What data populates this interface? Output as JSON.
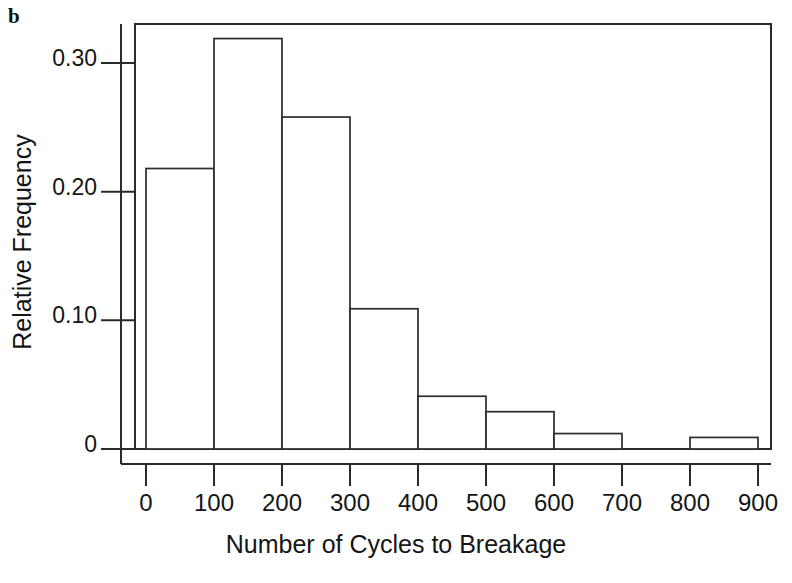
{
  "panel": {
    "letter": "b"
  },
  "chart_data": {
    "type": "bar",
    "subtype": "histogram",
    "title": "",
    "xlabel": "Number of Cycles to Breakage",
    "ylabel": "Relative Frequency",
    "bin_width": 100,
    "bin_edges": [
      0,
      100,
      200,
      300,
      400,
      500,
      600,
      700,
      800,
      900
    ],
    "categories": [
      "0-100",
      "100-200",
      "200-300",
      "300-400",
      "400-500",
      "500-600",
      "600-700",
      "700-800",
      "800-900"
    ],
    "values": [
      0.218,
      0.319,
      0.258,
      0.109,
      0.041,
      0.029,
      0.012,
      0.0,
      0.009
    ],
    "xlim": [
      0,
      900
    ],
    "ylim": [
      0,
      0.335
    ],
    "xticks": [
      0,
      100,
      200,
      300,
      400,
      500,
      600,
      700,
      800,
      900
    ],
    "xticklabels": [
      "0",
      "100",
      "200",
      "300",
      "400",
      "500",
      "600",
      "700",
      "800",
      "900"
    ],
    "yticks": [
      0,
      0.1,
      0.2,
      0.3
    ],
    "yticklabels": [
      "0",
      "0.10",
      "0.20",
      "0.30"
    ],
    "grid": false,
    "legend": false,
    "bar_fill_color": "#ffffff",
    "bar_edge_color": "#2b2b2b",
    "background_color": "#ffffff"
  }
}
